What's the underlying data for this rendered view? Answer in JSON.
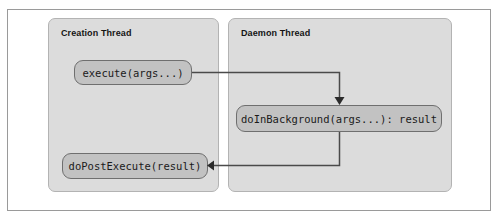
{
  "figure": {
    "kind": "sequence-flow-diagram",
    "colors": {
      "page_background": "#ffffff",
      "outer_frame_border": "#9a9a9a",
      "panel_fill": "#dcdcdc",
      "panel_border": "#b3b3b3",
      "node_fill": "#c2c2c2",
      "node_border": "#6f6f6f",
      "connector": "#4a4a4a",
      "text": "#141414"
    }
  },
  "panels": [
    {
      "id": "creation",
      "title": "Creation Thread"
    },
    {
      "id": "daemon",
      "title": "Daemon Thread"
    }
  ],
  "nodes": [
    {
      "id": "execute",
      "label": "execute(args...)",
      "panel": "creation"
    },
    {
      "id": "doInBackground",
      "label": "doInBackground(args...): result",
      "panel": "daemon"
    },
    {
      "id": "doPostExecute",
      "label": "doPostExecute(result)",
      "panel": "creation"
    }
  ],
  "connectors": [
    {
      "id": "execute-to-doinbackground",
      "from": "execute",
      "to": "doInBackground",
      "direction": "right-then-down",
      "arrowhead": "down"
    },
    {
      "id": "doinbackground-to-dopostexecute",
      "from": "doInBackground",
      "to": "doPostExecute",
      "direction": "down-then-left",
      "arrowhead": "left"
    }
  ]
}
